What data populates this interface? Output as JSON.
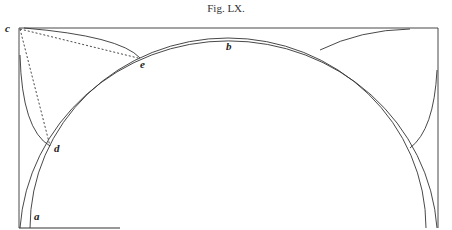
{
  "figure": {
    "title": "Fig. LX.",
    "labels": {
      "a": "a",
      "b": "b",
      "c": "c",
      "d": "d",
      "e": "e"
    },
    "stroke_color": "#333333"
  }
}
